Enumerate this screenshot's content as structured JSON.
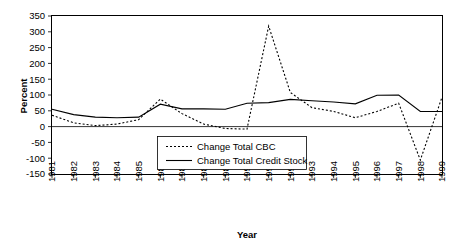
{
  "chart_data": {
    "type": "line",
    "title": "",
    "xlabel": "Year",
    "ylabel": "Percent",
    "x": [
      1981,
      1982,
      1983,
      1984,
      1985,
      1986,
      1987,
      1988,
      1989,
      1990,
      1991,
      1992,
      1993,
      1994,
      1995,
      1996,
      1997,
      1998,
      1999
    ],
    "categories": [
      "1981",
      "1982",
      "1983",
      "1984",
      "1985",
      "1986",
      "1987",
      "1988",
      "1989",
      "1990",
      "1991",
      "1992",
      "1993",
      "1994",
      "1995",
      "1996",
      "1997",
      "1998",
      "1999"
    ],
    "xlim": [
      1981,
      1999
    ],
    "ylim": [
      -150,
      350
    ],
    "yticks": [
      -150,
      -100,
      -50,
      0,
      50,
      100,
      150,
      200,
      250,
      300,
      350
    ],
    "ytick_labels": [
      "-150",
      "-100",
      "-50",
      "0",
      "50",
      "100",
      "150",
      "200",
      "250",
      "300",
      "350"
    ],
    "grid": false,
    "legend_position": "inside-bottom-center",
    "series": [
      {
        "name": "Change Total CBC",
        "style": "dotted",
        "color": "#000000",
        "values": [
          36,
          12,
          3,
          8,
          22,
          87,
          41,
          8,
          -6,
          -8,
          318,
          108,
          60,
          48,
          28,
          48,
          74,
          -106,
          93
        ]
      },
      {
        "name": "Change Total Credit Stock",
        "style": "solid",
        "color": "#000000",
        "values": [
          55,
          38,
          30,
          28,
          30,
          71,
          56,
          56,
          55,
          74,
          76,
          86,
          82,
          78,
          72,
          99,
          100,
          48,
          48
        ]
      }
    ]
  },
  "legend": {
    "entries": [
      {
        "label": "Change Total CBC",
        "style": "dotted"
      },
      {
        "label": "Change Total Credit Stock",
        "style": "solid"
      }
    ]
  }
}
